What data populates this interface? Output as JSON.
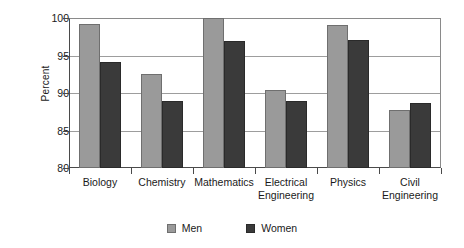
{
  "chart_data": {
    "type": "bar",
    "title": "",
    "subtitle": "",
    "xlabel": "",
    "ylabel": "Percent",
    "ylim": [
      80,
      100
    ],
    "ytick_values": [
      80,
      85,
      90,
      95,
      100
    ],
    "ytick_labels": [
      "80",
      "85",
      "90",
      "95",
      "100"
    ],
    "grid": "horizontal",
    "legend_position": "bottom-center",
    "categories": [
      "Biology",
      "Chemistry",
      "Mathematics",
      "Electrical Engineering",
      "Physics",
      "Civil Engineering"
    ],
    "category_lines": [
      [
        "Biology"
      ],
      [
        "Chemistry"
      ],
      [
        "Mathematics"
      ],
      [
        "Electrical",
        "Engineering"
      ],
      [
        "Physics"
      ],
      [
        "Civil",
        "Engineering"
      ]
    ],
    "series": [
      {
        "name": "Men",
        "color": "#9a9a9a",
        "values": [
          99.2,
          92.5,
          100,
          90.4,
          99.1,
          87.7
        ]
      },
      {
        "name": "Women",
        "color": "#3a3a3a",
        "values": [
          94.1,
          89.0,
          96.9,
          89.0,
          97.1,
          88.7
        ]
      }
    ]
  },
  "legend": {
    "entries": [
      {
        "label": "Men",
        "swatch": "men-swatch"
      },
      {
        "label": "Women",
        "swatch": "women-swatch"
      }
    ]
  },
  "colors": {
    "men": "#9a9a9a",
    "women": "#3a3a3a",
    "axis": "#4a4a4a",
    "grid": "#9d9d9d",
    "background": "#ffffff"
  }
}
